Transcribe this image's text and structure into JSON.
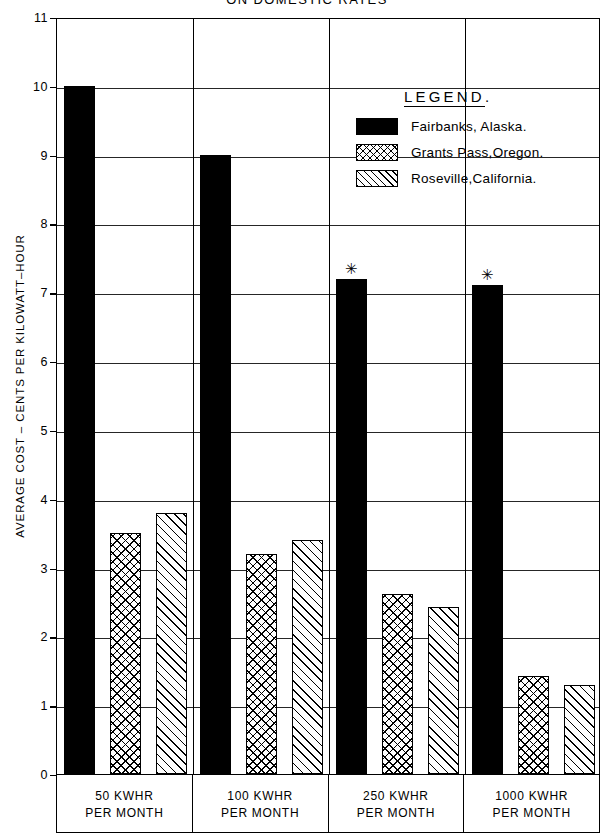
{
  "chart_data": {
    "type": "bar",
    "title": "ON DOMESTIC RATES",
    "xlabel": "",
    "ylabel": "AVERAGE COST – CENTS PER KILOWATT–HOUR",
    "ylim": [
      0,
      11
    ],
    "ytick_labels": [
      "11",
      "10",
      "9",
      "8",
      "7",
      "6",
      "5",
      "4",
      "3",
      "2",
      "1",
      "0"
    ],
    "ytick_values": [
      11,
      10,
      9,
      8,
      7,
      6,
      5,
      4,
      3,
      2,
      1,
      0
    ],
    "grid": true,
    "legend_position": "inside-top-right",
    "categories": [
      {
        "line1": "50 KWHR",
        "line2": "PER MONTH"
      },
      {
        "line1": "100 KWHR",
        "line2": "PER MONTH"
      },
      {
        "line1": "250 KWHR",
        "line2": "PER MONTH"
      },
      {
        "line1": "1000 KWHR",
        "line2": "PER MONTH"
      }
    ],
    "series": [
      {
        "name": "Fairbanks, Alaska.",
        "pattern": "solid",
        "values": [
          10.0,
          9.0,
          7.2,
          7.1
        ],
        "markers": [
          null,
          null,
          "✳",
          "✳"
        ]
      },
      {
        "name": "Grants Pass, Oregon.",
        "pattern": "cross",
        "values": [
          3.5,
          3.2,
          2.62,
          1.42
        ],
        "markers": [
          null,
          null,
          null,
          null
        ]
      },
      {
        "name": "Roseville, California.",
        "pattern": "diag",
        "values": [
          3.8,
          3.4,
          2.42,
          1.3
        ],
        "markers": [
          null,
          null,
          null,
          null
        ]
      }
    ],
    "annotations": [
      {
        "text": "✳",
        "category": "250 KWHR PER MONTH",
        "series": "Fairbanks, Alaska."
      },
      {
        "text": "✳",
        "category": "1000 KWHR PER MONTH",
        "series": "Fairbanks, Alaska."
      }
    ]
  },
  "legend": {
    "title": "LEGEND",
    "title_suffix": ".",
    "entries": [
      {
        "label": "Fairbanks, Alaska.",
        "pattern": "solid"
      },
      {
        "label": "Grants Pass,Oregon.",
        "pattern": "cross"
      },
      {
        "label": "Roseville,California.",
        "pattern": "diag"
      }
    ]
  },
  "colors": {
    "ink": "#000000",
    "paper": "#ffffff"
  }
}
